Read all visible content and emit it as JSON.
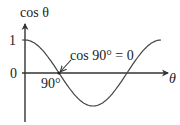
{
  "chart_data": {
    "type": "line",
    "title": "",
    "function": "cos",
    "xlabel": "θ",
    "ylabel": "cos θ",
    "x_unit": "degrees",
    "xlim": [
      0,
      360
    ],
    "ylim": [
      -1,
      1
    ],
    "x_ticks": [
      {
        "value": 90,
        "label": "90°"
      }
    ],
    "y_ticks": [
      {
        "value": 1,
        "label": "1"
      },
      {
        "value": 0,
        "label": "0"
      }
    ],
    "series": [
      {
        "name": "cos θ",
        "x": [
          0,
          45,
          90,
          135,
          180,
          225,
          270,
          315,
          360
        ],
        "y": [
          1,
          0.707,
          0,
          -0.707,
          -1,
          -0.707,
          0,
          0.707,
          1
        ]
      }
    ],
    "annotations": [
      {
        "text": "cos 90° = 0",
        "points_to": {
          "x": 90,
          "y": 0
        }
      }
    ],
    "grid": false,
    "legend": "none"
  },
  "colors": {
    "axis": "#333333",
    "curve": "#444444",
    "text": "#222222"
  }
}
